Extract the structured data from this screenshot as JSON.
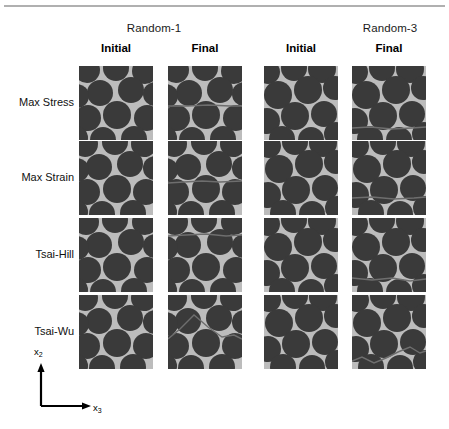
{
  "figure": {
    "rule_color": "#b0b0b0",
    "matrix_color": "#bcbcbc",
    "fiber_color": "#3a3a3a",
    "crack_color": "#6e6e6e"
  },
  "groups": [
    {
      "label": "Random-1"
    },
    {
      "label": "Random-3"
    }
  ],
  "columns": [
    {
      "label": "Initial"
    },
    {
      "label": "Final"
    },
    {
      "label": "Initial"
    },
    {
      "label": "Final"
    }
  ],
  "rows": [
    {
      "label": "Max Stress"
    },
    {
      "label": "Max Strain"
    },
    {
      "label": "Tsai-Hill"
    },
    {
      "label": "Tsai-Wu"
    }
  ],
  "axes": {
    "vertical_label": "x",
    "vertical_sub": "2",
    "horizontal_label": "x",
    "horizontal_sub": "3"
  },
  "tiles": [
    {
      "row": "Max Stress",
      "group": "Random-1",
      "state": "Initial",
      "fibers": [
        {
          "cx": 8,
          "cy": 4,
          "r": 13
        },
        {
          "cx": 37,
          "cy": 2,
          "r": 13
        },
        {
          "cx": 66,
          "cy": 5,
          "r": 13
        },
        {
          "cx": 21,
          "cy": 27,
          "r": 13
        },
        {
          "cx": 52,
          "cy": 24,
          "r": 13
        },
        {
          "cx": -2,
          "cy": 30,
          "r": 12
        },
        {
          "cx": 76,
          "cy": 28,
          "r": 12
        },
        {
          "cx": 9,
          "cy": 52,
          "r": 13
        },
        {
          "cx": 38,
          "cy": 49,
          "r": 14
        },
        {
          "cx": 68,
          "cy": 52,
          "r": 13
        },
        {
          "cx": 24,
          "cy": 74,
          "r": 13
        },
        {
          "cx": 55,
          "cy": 73,
          "r": 13
        },
        {
          "cx": -3,
          "cy": 72,
          "r": 12
        }
      ],
      "cracks": []
    },
    {
      "row": "Max Stress",
      "group": "Random-1",
      "state": "Final",
      "fibers": [
        {
          "cx": 8,
          "cy": 4,
          "r": 13
        },
        {
          "cx": 37,
          "cy": 2,
          "r": 13
        },
        {
          "cx": 66,
          "cy": 5,
          "r": 13
        },
        {
          "cx": 21,
          "cy": 27,
          "r": 13
        },
        {
          "cx": 52,
          "cy": 24,
          "r": 13
        },
        {
          "cx": -2,
          "cy": 30,
          "r": 12
        },
        {
          "cx": 76,
          "cy": 28,
          "r": 12
        },
        {
          "cx": 9,
          "cy": 52,
          "r": 13
        },
        {
          "cx": 38,
          "cy": 49,
          "r": 14
        },
        {
          "cx": 68,
          "cy": 52,
          "r": 13
        },
        {
          "cx": 24,
          "cy": 74,
          "r": 13
        },
        {
          "cx": 55,
          "cy": 73,
          "r": 13
        },
        {
          "cx": -3,
          "cy": 72,
          "r": 12
        }
      ],
      "cracks": [
        {
          "points": "0,40 20,40 40,39 62,40 74,40"
        }
      ]
    },
    {
      "row": "Max Stress",
      "group": "Random-3",
      "state": "Initial",
      "fibers": [
        {
          "cx": 4,
          "cy": 6,
          "r": 12
        },
        {
          "cx": 30,
          "cy": 2,
          "r": 13
        },
        {
          "cx": 58,
          "cy": 3,
          "r": 14
        },
        {
          "cx": 14,
          "cy": 29,
          "r": 14
        },
        {
          "cx": 44,
          "cy": 24,
          "r": 14
        },
        {
          "cx": 71,
          "cy": 22,
          "r": 12
        },
        {
          "cx": 3,
          "cy": 55,
          "r": 13
        },
        {
          "cx": 31,
          "cy": 50,
          "r": 14
        },
        {
          "cx": 60,
          "cy": 48,
          "r": 13
        },
        {
          "cx": 18,
          "cy": 73,
          "r": 13
        },
        {
          "cx": 47,
          "cy": 74,
          "r": 13
        },
        {
          "cx": 72,
          "cy": 68,
          "r": 12
        }
      ],
      "cracks": []
    },
    {
      "row": "Max Stress",
      "group": "Random-3",
      "state": "Final",
      "fibers": [
        {
          "cx": 4,
          "cy": 6,
          "r": 12
        },
        {
          "cx": 30,
          "cy": 2,
          "r": 13
        },
        {
          "cx": 58,
          "cy": 3,
          "r": 14
        },
        {
          "cx": 14,
          "cy": 29,
          "r": 14
        },
        {
          "cx": 44,
          "cy": 24,
          "r": 14
        },
        {
          "cx": 71,
          "cy": 22,
          "r": 12
        },
        {
          "cx": 3,
          "cy": 55,
          "r": 13
        },
        {
          "cx": 31,
          "cy": 50,
          "r": 14
        },
        {
          "cx": 60,
          "cy": 48,
          "r": 13
        },
        {
          "cx": 18,
          "cy": 73,
          "r": 13
        },
        {
          "cx": 47,
          "cy": 74,
          "r": 13
        },
        {
          "cx": 72,
          "cy": 68,
          "r": 12
        }
      ],
      "cracks": [
        {
          "points": "0,62 18,61 40,63 60,62 74,61"
        }
      ]
    },
    {
      "row": "Max Strain",
      "group": "Random-1",
      "state": "Initial",
      "fibers": [
        {
          "cx": 6,
          "cy": 3,
          "r": 13
        },
        {
          "cx": 36,
          "cy": 1,
          "r": 13
        },
        {
          "cx": 65,
          "cy": 3,
          "r": 13
        },
        {
          "cx": 20,
          "cy": 26,
          "r": 13
        },
        {
          "cx": 51,
          "cy": 23,
          "r": 13
        },
        {
          "cx": -2,
          "cy": 29,
          "r": 12
        },
        {
          "cx": 76,
          "cy": 27,
          "r": 12
        },
        {
          "cx": 8,
          "cy": 51,
          "r": 13
        },
        {
          "cx": 38,
          "cy": 48,
          "r": 14
        },
        {
          "cx": 67,
          "cy": 51,
          "r": 13
        },
        {
          "cx": 23,
          "cy": 73,
          "r": 13
        },
        {
          "cx": 54,
          "cy": 72,
          "r": 13
        },
        {
          "cx": -3,
          "cy": 71,
          "r": 12
        }
      ],
      "cracks": []
    },
    {
      "row": "Max Strain",
      "group": "Random-1",
      "state": "Final",
      "fibers": [
        {
          "cx": 6,
          "cy": 3,
          "r": 13
        },
        {
          "cx": 36,
          "cy": 1,
          "r": 13
        },
        {
          "cx": 65,
          "cy": 3,
          "r": 13
        },
        {
          "cx": 20,
          "cy": 26,
          "r": 13
        },
        {
          "cx": 51,
          "cy": 23,
          "r": 13
        },
        {
          "cx": -2,
          "cy": 29,
          "r": 12
        },
        {
          "cx": 76,
          "cy": 27,
          "r": 12
        },
        {
          "cx": 8,
          "cy": 51,
          "r": 13
        },
        {
          "cx": 38,
          "cy": 48,
          "r": 14
        },
        {
          "cx": 67,
          "cy": 51,
          "r": 13
        },
        {
          "cx": 23,
          "cy": 73,
          "r": 13
        },
        {
          "cx": 54,
          "cy": 72,
          "r": 13
        },
        {
          "cx": -3,
          "cy": 71,
          "r": 12
        }
      ],
      "cracks": [
        {
          "points": "0,42 16,41 34,40 52,41 74,40"
        }
      ]
    },
    {
      "row": "Max Strain",
      "group": "Random-3",
      "state": "Initial",
      "fibers": [
        {
          "cx": 5,
          "cy": 5,
          "r": 12
        },
        {
          "cx": 31,
          "cy": 1,
          "r": 13
        },
        {
          "cx": 59,
          "cy": 2,
          "r": 14
        },
        {
          "cx": 15,
          "cy": 28,
          "r": 14
        },
        {
          "cx": 45,
          "cy": 23,
          "r": 14
        },
        {
          "cx": 72,
          "cy": 21,
          "r": 12
        },
        {
          "cx": 4,
          "cy": 54,
          "r": 13
        },
        {
          "cx": 32,
          "cy": 49,
          "r": 14
        },
        {
          "cx": 61,
          "cy": 47,
          "r": 13
        },
        {
          "cx": 19,
          "cy": 72,
          "r": 13
        },
        {
          "cx": 48,
          "cy": 73,
          "r": 13
        },
        {
          "cx": 73,
          "cy": 67,
          "r": 12
        }
      ],
      "cracks": []
    },
    {
      "row": "Max Strain",
      "group": "Random-3",
      "state": "Final",
      "fibers": [
        {
          "cx": 5,
          "cy": 5,
          "r": 12
        },
        {
          "cx": 31,
          "cy": 1,
          "r": 13
        },
        {
          "cx": 59,
          "cy": 2,
          "r": 14
        },
        {
          "cx": 15,
          "cy": 28,
          "r": 14
        },
        {
          "cx": 45,
          "cy": 23,
          "r": 14
        },
        {
          "cx": 72,
          "cy": 21,
          "r": 12
        },
        {
          "cx": 4,
          "cy": 54,
          "r": 13
        },
        {
          "cx": 32,
          "cy": 49,
          "r": 14
        },
        {
          "cx": 61,
          "cy": 47,
          "r": 13
        },
        {
          "cx": 19,
          "cy": 72,
          "r": 13
        },
        {
          "cx": 48,
          "cy": 73,
          "r": 13
        },
        {
          "cx": 73,
          "cy": 67,
          "r": 12
        }
      ],
      "cracks": [
        {
          "points": "0,57 20,56 42,58 62,57 74,56"
        }
      ]
    },
    {
      "row": "Tsai-Hill",
      "group": "Random-1",
      "state": "Initial",
      "fibers": [
        {
          "cx": 7,
          "cy": 4,
          "r": 13
        },
        {
          "cx": 36,
          "cy": 2,
          "r": 13
        },
        {
          "cx": 66,
          "cy": 4,
          "r": 13
        },
        {
          "cx": 20,
          "cy": 27,
          "r": 13
        },
        {
          "cx": 52,
          "cy": 24,
          "r": 13
        },
        {
          "cx": -2,
          "cy": 30,
          "r": 12
        },
        {
          "cx": 76,
          "cy": 28,
          "r": 12
        },
        {
          "cx": 9,
          "cy": 52,
          "r": 13
        },
        {
          "cx": 38,
          "cy": 49,
          "r": 14
        },
        {
          "cx": 68,
          "cy": 52,
          "r": 13
        },
        {
          "cx": 24,
          "cy": 74,
          "r": 13
        },
        {
          "cx": 55,
          "cy": 73,
          "r": 13
        },
        {
          "cx": -3,
          "cy": 72,
          "r": 12
        }
      ],
      "cracks": []
    },
    {
      "row": "Tsai-Hill",
      "group": "Random-1",
      "state": "Final",
      "fibers": [
        {
          "cx": 7,
          "cy": 4,
          "r": 13
        },
        {
          "cx": 36,
          "cy": 2,
          "r": 13
        },
        {
          "cx": 66,
          "cy": 4,
          "r": 13
        },
        {
          "cx": 20,
          "cy": 27,
          "r": 13
        },
        {
          "cx": 52,
          "cy": 24,
          "r": 13
        },
        {
          "cx": -2,
          "cy": 30,
          "r": 12
        },
        {
          "cx": 76,
          "cy": 28,
          "r": 12
        },
        {
          "cx": 9,
          "cy": 52,
          "r": 13
        },
        {
          "cx": 38,
          "cy": 49,
          "r": 14
        },
        {
          "cx": 68,
          "cy": 52,
          "r": 13
        },
        {
          "cx": 24,
          "cy": 74,
          "r": 13
        },
        {
          "cx": 55,
          "cy": 73,
          "r": 13
        },
        {
          "cx": -3,
          "cy": 72,
          "r": 12
        }
      ],
      "cracks": [
        {
          "points": "0,18 18,17 38,16 58,18 74,17"
        }
      ]
    },
    {
      "row": "Tsai-Hill",
      "group": "Random-3",
      "state": "Initial",
      "fibers": [
        {
          "cx": 4,
          "cy": 6,
          "r": 12
        },
        {
          "cx": 30,
          "cy": 2,
          "r": 13
        },
        {
          "cx": 58,
          "cy": 3,
          "r": 14
        },
        {
          "cx": 14,
          "cy": 29,
          "r": 14
        },
        {
          "cx": 44,
          "cy": 24,
          "r": 14
        },
        {
          "cx": 71,
          "cy": 22,
          "r": 12
        },
        {
          "cx": 3,
          "cy": 55,
          "r": 13
        },
        {
          "cx": 31,
          "cy": 50,
          "r": 14
        },
        {
          "cx": 60,
          "cy": 48,
          "r": 13
        },
        {
          "cx": 18,
          "cy": 73,
          "r": 13
        },
        {
          "cx": 47,
          "cy": 74,
          "r": 13
        },
        {
          "cx": 72,
          "cy": 68,
          "r": 12
        }
      ],
      "cracks": []
    },
    {
      "row": "Tsai-Hill",
      "group": "Random-3",
      "state": "Final",
      "fibers": [
        {
          "cx": 4,
          "cy": 6,
          "r": 12
        },
        {
          "cx": 30,
          "cy": 2,
          "r": 13
        },
        {
          "cx": 58,
          "cy": 3,
          "r": 14
        },
        {
          "cx": 14,
          "cy": 29,
          "r": 14
        },
        {
          "cx": 44,
          "cy": 24,
          "r": 14
        },
        {
          "cx": 71,
          "cy": 22,
          "r": 12
        },
        {
          "cx": 3,
          "cy": 55,
          "r": 13
        },
        {
          "cx": 31,
          "cy": 50,
          "r": 14
        },
        {
          "cx": 60,
          "cy": 48,
          "r": 13
        },
        {
          "cx": 18,
          "cy": 73,
          "r": 13
        },
        {
          "cx": 47,
          "cy": 74,
          "r": 13
        },
        {
          "cx": 72,
          "cy": 68,
          "r": 12
        }
      ],
      "cracks": [
        {
          "points": "0,60 20,62 40,60 58,63 74,61"
        }
      ]
    },
    {
      "row": "Tsai-Wu",
      "group": "Random-1",
      "state": "Initial",
      "fibers": [
        {
          "cx": 6,
          "cy": 3,
          "r": 13
        },
        {
          "cx": 36,
          "cy": 1,
          "r": 13
        },
        {
          "cx": 65,
          "cy": 3,
          "r": 13
        },
        {
          "cx": 20,
          "cy": 26,
          "r": 13
        },
        {
          "cx": 51,
          "cy": 23,
          "r": 13
        },
        {
          "cx": -2,
          "cy": 29,
          "r": 12
        },
        {
          "cx": 76,
          "cy": 27,
          "r": 12
        },
        {
          "cx": 8,
          "cy": 51,
          "r": 13
        },
        {
          "cx": 38,
          "cy": 48,
          "r": 14
        },
        {
          "cx": 67,
          "cy": 51,
          "r": 13
        },
        {
          "cx": 23,
          "cy": 73,
          "r": 13
        },
        {
          "cx": 54,
          "cy": 72,
          "r": 13
        },
        {
          "cx": -3,
          "cy": 71,
          "r": 12
        }
      ],
      "cracks": []
    },
    {
      "row": "Tsai-Wu",
      "group": "Random-1",
      "state": "Final",
      "fibers": [
        {
          "cx": 6,
          "cy": 3,
          "r": 13
        },
        {
          "cx": 36,
          "cy": 1,
          "r": 13
        },
        {
          "cx": 65,
          "cy": 3,
          "r": 13
        },
        {
          "cx": 20,
          "cy": 26,
          "r": 13
        },
        {
          "cx": 51,
          "cy": 23,
          "r": 13
        },
        {
          "cx": -2,
          "cy": 29,
          "r": 12
        },
        {
          "cx": 76,
          "cy": 27,
          "r": 12
        },
        {
          "cx": 8,
          "cy": 51,
          "r": 13
        },
        {
          "cx": 38,
          "cy": 48,
          "r": 14
        },
        {
          "cx": 67,
          "cy": 51,
          "r": 13
        },
        {
          "cx": 23,
          "cy": 73,
          "r": 13
        },
        {
          "cx": 54,
          "cy": 72,
          "r": 13
        },
        {
          "cx": -3,
          "cy": 71,
          "r": 12
        }
      ],
      "cracks": [
        {
          "points": "0,44 12,34 26,20 40,32 54,42 66,40 74,44"
        }
      ]
    },
    {
      "row": "Tsai-Wu",
      "group": "Random-3",
      "state": "Initial",
      "fibers": [
        {
          "cx": 5,
          "cy": 5,
          "r": 12
        },
        {
          "cx": 31,
          "cy": 1,
          "r": 13
        },
        {
          "cx": 59,
          "cy": 2,
          "r": 14
        },
        {
          "cx": 15,
          "cy": 28,
          "r": 14
        },
        {
          "cx": 45,
          "cy": 23,
          "r": 14
        },
        {
          "cx": 72,
          "cy": 21,
          "r": 12
        },
        {
          "cx": 4,
          "cy": 54,
          "r": 13
        },
        {
          "cx": 32,
          "cy": 49,
          "r": 14
        },
        {
          "cx": 61,
          "cy": 47,
          "r": 13
        },
        {
          "cx": 19,
          "cy": 72,
          "r": 13
        },
        {
          "cx": 48,
          "cy": 73,
          "r": 13
        },
        {
          "cx": 73,
          "cy": 67,
          "r": 12
        }
      ],
      "cracks": []
    },
    {
      "row": "Tsai-Wu",
      "group": "Random-3",
      "state": "Final",
      "fibers": [
        {
          "cx": 5,
          "cy": 5,
          "r": 12
        },
        {
          "cx": 31,
          "cy": 1,
          "r": 13
        },
        {
          "cx": 59,
          "cy": 2,
          "r": 14
        },
        {
          "cx": 15,
          "cy": 28,
          "r": 14
        },
        {
          "cx": 45,
          "cy": 23,
          "r": 14
        },
        {
          "cx": 72,
          "cy": 21,
          "r": 12
        },
        {
          "cx": 4,
          "cy": 54,
          "r": 13
        },
        {
          "cx": 32,
          "cy": 49,
          "r": 14
        },
        {
          "cx": 61,
          "cy": 47,
          "r": 13
        },
        {
          "cx": 19,
          "cy": 72,
          "r": 13
        },
        {
          "cx": 48,
          "cy": 73,
          "r": 13
        },
        {
          "cx": 73,
          "cy": 67,
          "r": 12
        }
      ],
      "cracks": [
        {
          "points": "0,66 10,62 22,68 34,63 46,57 58,52 68,58 74,56"
        }
      ]
    }
  ],
  "layout": {
    "tile_size": 74,
    "col_x": [
      79,
      168,
      264,
      352
    ],
    "row_y": [
      66,
      141,
      218,
      295
    ],
    "group_header_y": 22,
    "col_header_y": 42,
    "group_center_x": [
      154,
      390
    ]
  }
}
